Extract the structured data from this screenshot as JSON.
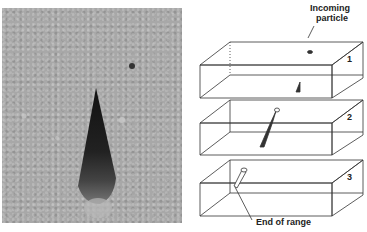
{
  "photo": {
    "description": "track of charged particle in emulsion, tapering dark streak"
  },
  "diagram": {
    "incoming_label_line1": "Incoming",
    "incoming_label_line2": "particle",
    "end_label": "End of range",
    "boxes": [
      {
        "number": "1"
      },
      {
        "number": "2"
      },
      {
        "number": "3"
      }
    ]
  },
  "colors": {
    "photo_bg": "#a8a8a8",
    "ink": "#222222"
  }
}
